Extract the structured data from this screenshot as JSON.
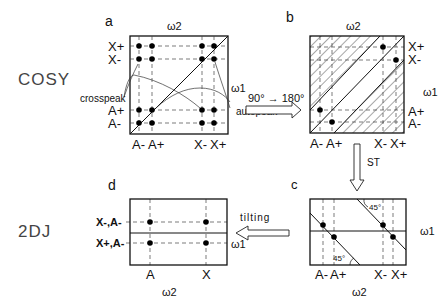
{
  "rows": {
    "top": "COSY",
    "bottom": "2DJ"
  },
  "panels": {
    "a": {
      "letter": "a",
      "axis_top": "ω2",
      "axis_right": "ω1",
      "y_labels": [
        "X+",
        "X-",
        "A+",
        "A-"
      ],
      "x_labels": [
        "A-",
        "A+",
        "X-",
        "X+"
      ],
      "callouts": [
        "crosspeak",
        "autopeak"
      ]
    },
    "b": {
      "letter": "b",
      "axis_top": "ω2",
      "axis_right": "ω1",
      "y_labels": [
        "X+",
        "X-",
        "A+",
        "A-"
      ],
      "x_labels": [
        "A-",
        "A+",
        "X-",
        "X+"
      ]
    },
    "c": {
      "letter": "c",
      "axis_bottom": "ω2",
      "axis_right": "ω1",
      "x_labels": [
        "A-",
        "A+",
        "X-",
        "X+"
      ],
      "angle_labels": [
        "45°",
        "45°"
      ]
    },
    "d": {
      "letter": "d",
      "axis_bottom": "ω2",
      "axis_right": "ω1",
      "y_labels": [
        "X-,A-",
        "X+,A-"
      ],
      "x_labels": [
        "A",
        "X"
      ]
    }
  },
  "arrows": {
    "a_to_b": "90° → 180°",
    "b_to_c": "ST",
    "c_to_d": "tilting"
  }
}
